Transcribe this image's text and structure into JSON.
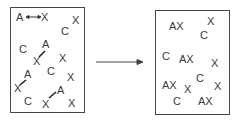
{
  "left_panel": {
    "labels": [
      {
        "text": "A",
        "x": 16,
        "y": 12
      },
      {
        "text": "X",
        "x": 41,
        "y": 12
      },
      {
        "text": "X",
        "x": 72,
        "y": 15
      },
      {
        "text": "C",
        "x": 61,
        "y": 26
      },
      {
        "text": "C",
        "x": 19,
        "y": 44
      },
      {
        "text": "A",
        "x": 42,
        "y": 39
      },
      {
        "text": "X",
        "x": 33,
        "y": 56
      },
      {
        "text": "X",
        "x": 59,
        "y": 53
      },
      {
        "text": "C",
        "x": 47,
        "y": 66
      },
      {
        "text": "A",
        "x": 24,
        "y": 69
      },
      {
        "text": "X",
        "x": 67,
        "y": 72
      },
      {
        "text": "X",
        "x": 14,
        "y": 83
      },
      {
        "text": "A",
        "x": 57,
        "y": 85
      },
      {
        "text": "C",
        "x": 24,
        "y": 96
      },
      {
        "text": "X",
        "x": 42,
        "y": 99
      },
      {
        "text": "X",
        "x": 68,
        "y": 98
      }
    ]
  },
  "right_panel": {
    "labels": [
      {
        "text": "AX",
        "x": 169,
        "y": 21
      },
      {
        "text": "X",
        "x": 207,
        "y": 16
      },
      {
        "text": "C",
        "x": 200,
        "y": 30
      },
      {
        "text": "C",
        "x": 162,
        "y": 51
      },
      {
        "text": "AX",
        "x": 179,
        "y": 54
      },
      {
        "text": "X",
        "x": 211,
        "y": 58
      },
      {
        "text": "C",
        "x": 196,
        "y": 73
      },
      {
        "text": "AX",
        "x": 162,
        "y": 80
      },
      {
        "text": "X",
        "x": 184,
        "y": 84
      },
      {
        "text": "X",
        "x": 214,
        "y": 81
      },
      {
        "text": "C",
        "x": 173,
        "y": 96
      },
      {
        "text": "AX",
        "x": 198,
        "y": 96
      }
    ]
  },
  "arrow": {
    "from_x": 96,
    "to_x": 143,
    "y": 62
  }
}
